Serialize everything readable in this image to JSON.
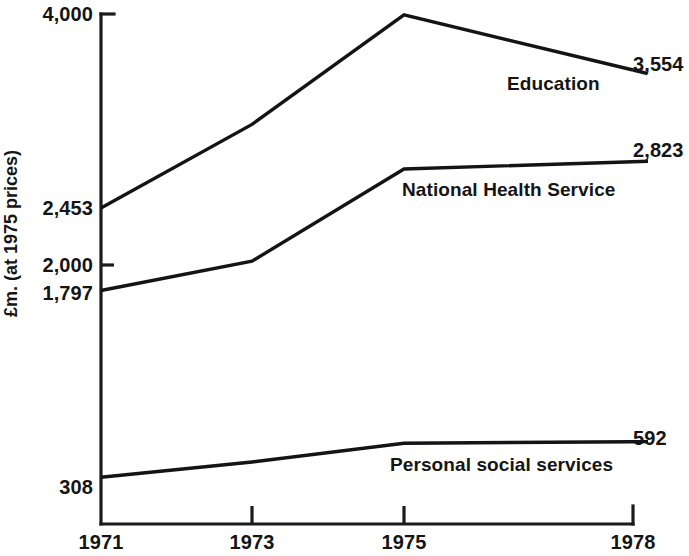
{
  "chart_data": {
    "type": "line",
    "title": "",
    "xlabel": "",
    "ylabel": "£m. (at 1975 prices)",
    "x": [
      1971,
      1973,
      1975,
      1978
    ],
    "xtick_labels": [
      "1971",
      "1973",
      "1975",
      "1978"
    ],
    "ytick_labels": [
      "4,000",
      "2,453",
      "2,000",
      "1,797",
      "308"
    ],
    "ytick_values": [
      4000,
      2453,
      2000,
      1797,
      308
    ],
    "ylim": [
      -60,
      4060
    ],
    "grid": false,
    "legend": "inline-right",
    "series": [
      {
        "name": "Education",
        "values": [
          2453,
          3120,
          3993,
          3554
        ],
        "start_label": "2,453",
        "end_label": "3,554"
      },
      {
        "name": "National Health Service",
        "values": [
          1797,
          2030,
          2765,
          2823
        ],
        "start_label": "1,797",
        "end_label": "2,823"
      },
      {
        "name": "Personal social services",
        "values": [
          308,
          430,
          580,
          592
        ],
        "start_label": "308",
        "end_label": "592"
      }
    ]
  },
  "axis": {
    "y_title": "£m. (at 1975 prices)",
    "y_labels": {
      "top": "4,000",
      "education_start": "2,453",
      "mid": "2,000",
      "nhs_start": "1,797",
      "pss_start": "308"
    },
    "x_labels": {
      "t1": "1971",
      "t2": "1973",
      "t3": "1975",
      "t4": "1978"
    }
  },
  "annotations": {
    "education_name": "Education",
    "education_value": "3,554",
    "nhs_name": "National Health Service",
    "nhs_value": "2,823",
    "pss_name": "Personal social services",
    "pss_value": "592"
  },
  "colors": {
    "line": "#141414",
    "axis": "#1b1b1b",
    "background": "#ffffff",
    "text": "#151515"
  }
}
